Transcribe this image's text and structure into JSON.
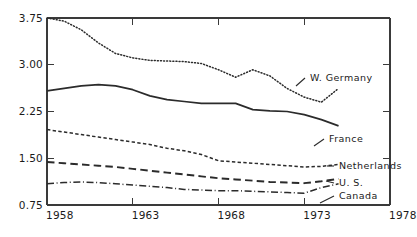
{
  "chart_data": {
    "type": "line",
    "title": "",
    "subtitle": "",
    "xlabel": "",
    "ylabel": "",
    "xlim": [
      1958,
      1978
    ],
    "ylim": [
      0.75,
      3.75
    ],
    "grid": false,
    "legend_position": "inline-right-end-labels",
    "x_ticks": [
      "1958",
      "1963",
      "1968",
      "1973",
      "1978"
    ],
    "x_tick_values": [
      1958,
      1963,
      1968,
      1973,
      1978
    ],
    "y_ticks": [
      "0.75",
      "1.50",
      "2.25",
      "3.00",
      "3.75"
    ],
    "y_tick_values": [
      0.75,
      1.5,
      2.25,
      3.0,
      3.75
    ],
    "x": [
      1958,
      1959,
      1960,
      1961,
      1962,
      1963,
      1964,
      1965,
      1966,
      1967,
      1968,
      1969,
      1970,
      1971,
      1972,
      1973,
      1974,
      1975
    ],
    "series": [
      {
        "name": "W. Germany",
        "style": "dotted",
        "label": "W. Germany",
        "values": [
          3.75,
          3.7,
          3.56,
          3.35,
          3.18,
          3.11,
          3.07,
          3.06,
          3.05,
          3.02,
          2.92,
          2.8,
          2.92,
          2.82,
          2.62,
          2.48,
          2.4,
          2.62
        ]
      },
      {
        "name": "France",
        "style": "solid",
        "label": "France",
        "values": [
          2.58,
          2.62,
          2.66,
          2.68,
          2.66,
          2.6,
          2.5,
          2.44,
          2.41,
          2.38,
          2.38,
          2.38,
          2.28,
          2.26,
          2.25,
          2.2,
          2.12,
          2.02
        ]
      },
      {
        "name": "Netherlands",
        "style": "finedash",
        "label": "Netherlands",
        "values": [
          1.96,
          1.92,
          1.88,
          1.84,
          1.8,
          1.76,
          1.72,
          1.66,
          1.62,
          1.56,
          1.46,
          1.44,
          1.42,
          1.4,
          1.38,
          1.36,
          1.37,
          1.4
        ]
      },
      {
        "name": "U.S.",
        "style": "longdash",
        "label": "U. S.",
        "values": [
          1.44,
          1.42,
          1.4,
          1.38,
          1.36,
          1.33,
          1.3,
          1.27,
          1.24,
          1.21,
          1.18,
          1.16,
          1.14,
          1.12,
          1.11,
          1.1,
          1.13,
          1.17
        ]
      },
      {
        "name": "Canada",
        "style": "dashdot",
        "label": "Canada",
        "values": [
          1.09,
          1.11,
          1.12,
          1.11,
          1.09,
          1.07,
          1.05,
          1.03,
          1.0,
          0.99,
          0.98,
          0.98,
          0.97,
          0.96,
          0.95,
          0.94,
          1.03,
          1.09
        ]
      }
    ],
    "annotations": [
      {
        "text": "W. Germany",
        "near_series": "W. Germany"
      },
      {
        "text": "France",
        "near_series": "France"
      },
      {
        "text": "Netherlands",
        "near_series": "Netherlands"
      },
      {
        "text": "U. S.",
        "near_series": "U.S."
      },
      {
        "text": "Canada",
        "near_series": "Canada"
      }
    ],
    "colors": {
      "line": "#2b2b2b",
      "axis": "#3a3a3a",
      "text": "#1a1a1a",
      "background": "#ffffff"
    }
  }
}
